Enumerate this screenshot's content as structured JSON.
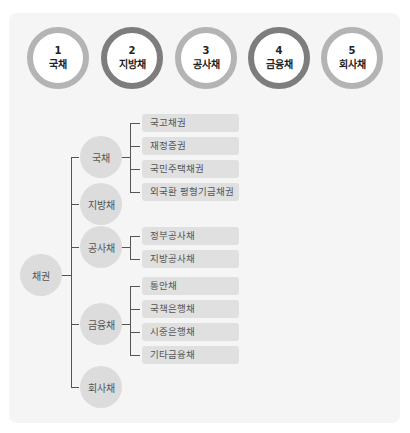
{
  "steps": [
    {
      "num": "1",
      "label": "국채"
    },
    {
      "num": "2",
      "label": "지방채"
    },
    {
      "num": "3",
      "label": "공사채"
    },
    {
      "num": "4",
      "label": "금융채"
    },
    {
      "num": "5",
      "label": "회사채"
    }
  ],
  "tree": {
    "root": "채권",
    "branches": [
      {
        "label": "국채",
        "children": [
          "국고채권",
          "재정증권",
          "국민주택채권",
          "외국환 평형기금채권"
        ]
      },
      {
        "label": "지방채",
        "children": []
      },
      {
        "label": "공사채",
        "children": [
          "정부공사채",
          "지방공사채"
        ]
      },
      {
        "label": "금융채",
        "children": [
          "통안채",
          "국책은행채",
          "시중은행채",
          "기타금융채"
        ]
      },
      {
        "label": "회사채",
        "children": []
      }
    ]
  },
  "colors": {
    "ring_light": "#b4b4b4",
    "ring_dark": "#7d7d7d",
    "node": "#dcdcdc",
    "leaf": "#e0e0e0"
  }
}
